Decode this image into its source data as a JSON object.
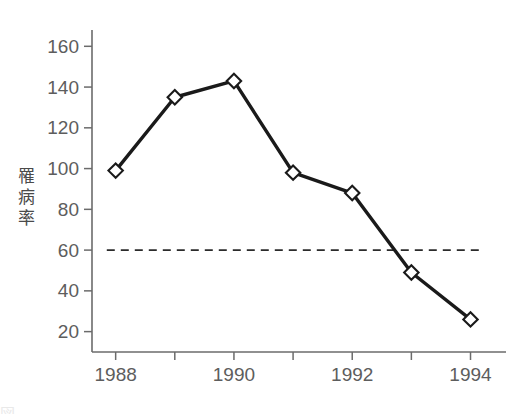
{
  "chart_data": {
    "type": "line",
    "title": "",
    "xlabel": "",
    "ylabel": "罹病率",
    "x": [
      1988,
      1989,
      1990,
      1991,
      1992,
      1993,
      1994
    ],
    "values": [
      99,
      135,
      143,
      98,
      88,
      49,
      26
    ],
    "xlim": [
      1987.6,
      1994.6
    ],
    "ylim": [
      10,
      168
    ],
    "y_ticks": [
      20,
      40,
      60,
      80,
      100,
      120,
      140,
      160
    ],
    "y_tick_labels": [
      "20",
      "40",
      "60",
      "80",
      "100",
      "120",
      "140",
      "160"
    ],
    "x_ticks": [
      1988,
      1989,
      1990,
      1991,
      1992,
      1993,
      1994
    ],
    "x_tick_labels": [
      "1988",
      "",
      "1990",
      "",
      "1992",
      "",
      "1994"
    ],
    "grid": false,
    "legend": false,
    "marker": "open-diamond",
    "annotations": [
      {
        "type": "horizontal-reference-line",
        "style": "dashed",
        "y": 60,
        "x_start": 1987.85,
        "x_end": 1994.15,
        "label": ""
      }
    ],
    "colors": {
      "line": "#1a1a1a",
      "marker_fill": "#ffffff",
      "marker_edge": "#1a1a1a",
      "axis": "#6b6b6b",
      "tick_text": "#5d5d5d",
      "reference_line": "#2b2b2b",
      "background": "#ffffff"
    }
  },
  "axis_title": {
    "y_chars": [
      "罹",
      "病",
      "率"
    ]
  },
  "caption_ghost": {
    "text": "図"
  }
}
